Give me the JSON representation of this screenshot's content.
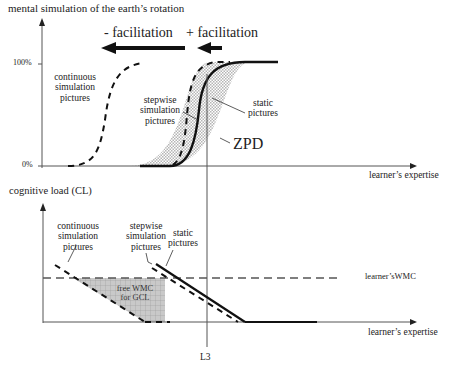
{
  "top_chart": {
    "y_axis_title": "mental simulation of the earth’s rotation",
    "tick_100": "100%",
    "tick_0": "0%",
    "x_axis_label": "learner’s expertise",
    "minus_facilitation": "- facilitation",
    "plus_facilitation": "+ facilitation",
    "curves": {
      "continuous": [
        "continuous",
        "simulation",
        "pictures"
      ],
      "stepwise": [
        "stepwise",
        "simulation",
        "pictures"
      ],
      "static": [
        "static",
        "pictures"
      ]
    },
    "zpd_label": "ZPD"
  },
  "bottom_chart": {
    "y_axis_title": "cognitive load (CL)",
    "x_axis_label": "learner’s expertise",
    "wmc_label": "learner’sWMC",
    "free_wmc": [
      "free WMC",
      "for GCL"
    ],
    "curves": {
      "continuous": [
        "continuous",
        "simulation",
        "pictures"
      ],
      "stepwise": [
        "stepwise",
        "simulation",
        "pictures"
      ],
      "static": [
        "static",
        "pictures"
      ]
    }
  },
  "marker": {
    "label": "L3"
  },
  "colors": {
    "line": "#111111",
    "axis": "#555555",
    "shade": "#c8c8c8"
  }
}
